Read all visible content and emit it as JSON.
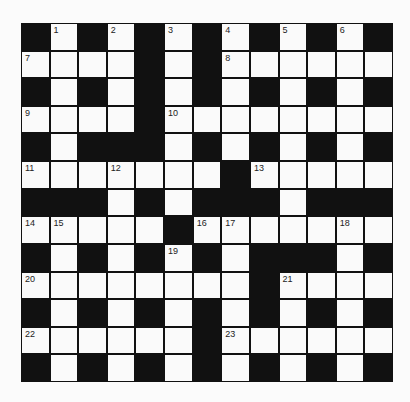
{
  "puzzle": {
    "rows": 13,
    "cols": 13,
    "grid": [
      "#.#.#.#.#.#.#",
      "....#.#......",
      "#.#.#.#.#.#.#",
      "....#........",
      "#.###.#.#.#.#",
      ".......#.....",
      "###.#.###.###",
      ".....#.......",
      "#.#.#.#.###.#",
      "........#....",
      "#.#.#.#.#.#.#",
      "......#......",
      "#.#.#.#.#.#.#"
    ],
    "numbers": [
      {
        "r": 0,
        "c": 1,
        "n": "1"
      },
      {
        "r": 0,
        "c": 3,
        "n": "2"
      },
      {
        "r": 0,
        "c": 5,
        "n": "3"
      },
      {
        "r": 0,
        "c": 7,
        "n": "4"
      },
      {
        "r": 0,
        "c": 9,
        "n": "5"
      },
      {
        "r": 0,
        "c": 11,
        "n": "6"
      },
      {
        "r": 1,
        "c": 0,
        "n": "7"
      },
      {
        "r": 1,
        "c": 7,
        "n": "8"
      },
      {
        "r": 3,
        "c": 0,
        "n": "9"
      },
      {
        "r": 3,
        "c": 5,
        "n": "10"
      },
      {
        "r": 5,
        "c": 0,
        "n": "11"
      },
      {
        "r": 5,
        "c": 3,
        "n": "12"
      },
      {
        "r": 5,
        "c": 8,
        "n": "13"
      },
      {
        "r": 7,
        "c": 0,
        "n": "14"
      },
      {
        "r": 7,
        "c": 1,
        "n": "15"
      },
      {
        "r": 7,
        "c": 6,
        "n": "16"
      },
      {
        "r": 7,
        "c": 7,
        "n": "17"
      },
      {
        "r": 7,
        "c": 11,
        "n": "18"
      },
      {
        "r": 8,
        "c": 5,
        "n": "19"
      },
      {
        "r": 9,
        "c": 0,
        "n": "20"
      },
      {
        "r": 9,
        "c": 9,
        "n": "21"
      },
      {
        "r": 11,
        "c": 0,
        "n": "22"
      },
      {
        "r": 11,
        "c": 7,
        "n": "23"
      }
    ],
    "colors": {
      "block": "#111111",
      "cell": "#fafafa",
      "background": "#fbfbfb"
    }
  }
}
